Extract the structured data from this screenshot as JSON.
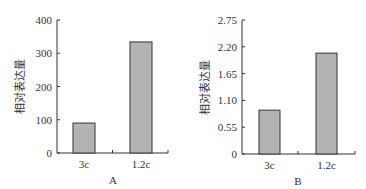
{
  "chart_data": [
    {
      "type": "bar",
      "panel": "A",
      "title": "",
      "xlabel": "A",
      "ylabel": "相对表达量",
      "categories": [
        "3c",
        "1.2c"
      ],
      "values": [
        90,
        334
      ],
      "ylim": [
        0,
        400
      ],
      "yticks": [
        0,
        100,
        200,
        300,
        400
      ],
      "ytick_labels": [
        "0",
        "100",
        "200",
        "300",
        "400"
      ],
      "grid": false,
      "legend": null,
      "bar_color": "#b3b3b3",
      "edge_color": "#333333"
    },
    {
      "type": "bar",
      "panel": "B",
      "title": "",
      "xlabel": "B",
      "ylabel": "相对表达量",
      "categories": [
        "3c",
        "1.2c"
      ],
      "values": [
        0.9,
        2.07
      ],
      "ylim": [
        0,
        2.75
      ],
      "yticks": [
        0,
        0.55,
        1.1,
        1.65,
        2.2,
        2.75
      ],
      "ytick_labels": [
        "0",
        "0.55",
        "1.10",
        "1.65",
        "2.20",
        "2.75"
      ],
      "grid": false,
      "legend": null,
      "bar_color": "#b3b3b3",
      "edge_color": "#333333"
    }
  ]
}
